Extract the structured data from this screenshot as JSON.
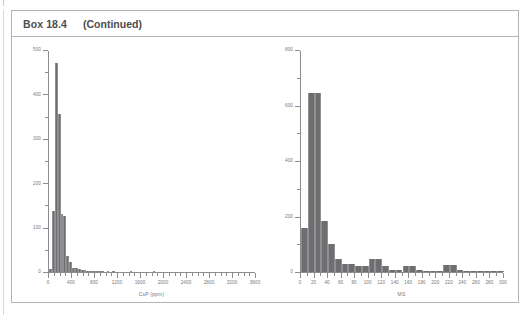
{
  "box": {
    "number_label": "Box 18.4",
    "continued_label": "(Continued)"
  },
  "chart_data": [
    {
      "id": "left",
      "type": "bar",
      "title": "",
      "xlabel": "CsP (ppm)",
      "ylabel": "",
      "xlim": [
        0,
        3600
      ],
      "ylim": [
        0,
        500
      ],
      "x_major_ticks": [
        0,
        400,
        800,
        1200,
        1600,
        2000,
        2400,
        2800,
        3200,
        3600
      ],
      "x_tick_labels": [
        "0",
        "400",
        "800",
        "1200",
        "1600",
        "2000",
        "2400",
        "2800",
        "3200",
        "3600"
      ],
      "x_minor_interval": 100,
      "y_major_ticks": [
        0,
        100,
        200,
        300,
        400,
        500
      ],
      "y_tick_labels": [
        "0",
        "100",
        "200",
        "300",
        "400",
        "500"
      ],
      "y_minor_interval": 50,
      "bin_width": 50,
      "bin_starts": [
        0,
        50,
        100,
        150,
        200,
        250,
        300,
        350,
        400,
        450,
        500,
        550,
        600,
        650,
        700,
        750,
        800,
        850,
        900,
        1000,
        1100,
        1400,
        1800
      ],
      "values": [
        6,
        137,
        470,
        355,
        130,
        126,
        37,
        22,
        10,
        8,
        6,
        5,
        4,
        3,
        2,
        2,
        2,
        1,
        1,
        1,
        1,
        1,
        1
      ],
      "grid": false,
      "legend": "none"
    },
    {
      "id": "right",
      "type": "bar",
      "title": "",
      "xlabel": "MS",
      "ylabel": "",
      "xlim": [
        0,
        300
      ],
      "ylim": [
        0,
        800
      ],
      "x_major_ticks": [
        0,
        20,
        40,
        60,
        80,
        100,
        120,
        140,
        160,
        180,
        200,
        220,
        240,
        260,
        280,
        300
      ],
      "x_tick_labels": [
        "0",
        "20",
        "40",
        "60",
        "80",
        "100",
        "120",
        "140",
        "160",
        "180",
        "200",
        "220",
        "240",
        "260",
        "280",
        "300"
      ],
      "x_minor_interval": 10,
      "y_major_ticks": [
        0,
        200,
        400,
        600,
        800
      ],
      "y_tick_labels": [
        "0",
        "200",
        "400",
        "600",
        "800"
      ],
      "y_minor_interval": 100,
      "bin_width": 10,
      "bin_starts": [
        0,
        10,
        20,
        30,
        40,
        50,
        60,
        70,
        80,
        90,
        100,
        110,
        120,
        130,
        140,
        150,
        160,
        170,
        180,
        190,
        200,
        210,
        220,
        230,
        240,
        250,
        260,
        270,
        280,
        290
      ],
      "values": [
        160,
        645,
        645,
        185,
        100,
        48,
        30,
        30,
        20,
        20,
        46,
        46,
        20,
        8,
        8,
        22,
        22,
        8,
        4,
        4,
        4,
        26,
        26,
        8,
        4,
        3,
        2,
        2,
        1,
        1
      ],
      "grid": false,
      "legend": "none"
    }
  ]
}
